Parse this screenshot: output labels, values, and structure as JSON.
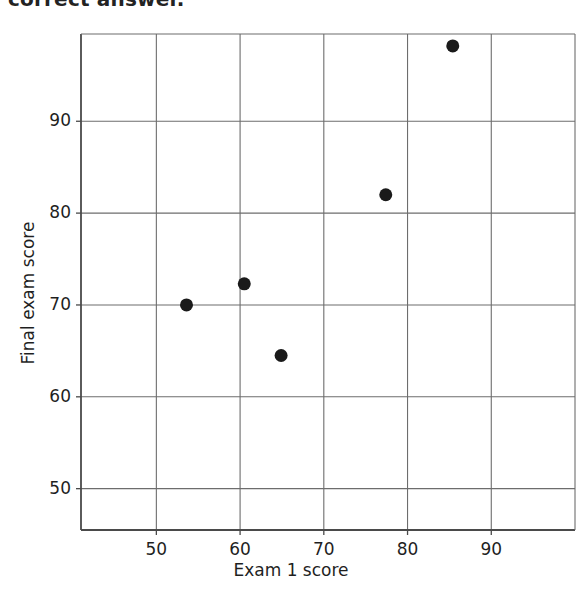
{
  "heading": {
    "text": "correct answer.",
    "clipped": true
  },
  "chart_data": {
    "type": "scatter",
    "title": "",
    "xlabel": "Exam 1 score",
    "ylabel": "Final exam score",
    "xlim": [
      41,
      100
    ],
    "ylim": [
      45.5,
      99.5
    ],
    "xticks": [
      50,
      60,
      70,
      80,
      90
    ],
    "yticks": [
      50,
      60,
      70,
      80,
      90
    ],
    "grid": true,
    "legend": "none",
    "marker": {
      "shape": "circle",
      "color": "#1a1a1a",
      "size": 13
    },
    "points": [
      {
        "x": 53.6,
        "y": 70.0
      },
      {
        "x": 60.5,
        "y": 72.3
      },
      {
        "x": 64.9,
        "y": 64.5
      },
      {
        "x": 77.4,
        "y": 82.0
      },
      {
        "x": 85.4,
        "y": 98.2
      }
    ],
    "series": [
      {
        "name": "Exam 1 vs Final",
        "x": [
          53.6,
          60.5,
          64.9,
          77.4,
          85.4
        ],
        "values": [
          70.0,
          72.3,
          64.5,
          82.0,
          98.2
        ]
      }
    ]
  },
  "colors": {
    "marker": "#1a1a1a",
    "axis": "#4a4a4a",
    "grid": "#6d6d6d",
    "text": "#1f1f1f",
    "background": "#ffffff"
  }
}
